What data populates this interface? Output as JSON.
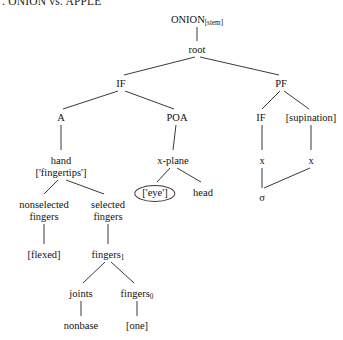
{
  "caption": {
    "text": ". ONION vs. APPLE"
  },
  "diagram": {
    "type": "linguistic-tree",
    "line_color": "#3a3a3a",
    "background": "#ffffff",
    "nodes": [
      {
        "id": "onion",
        "label": "ONION",
        "sub": "[stem]",
        "x": 197,
        "y": 14
      },
      {
        "id": "root",
        "label": "root",
        "x": 197,
        "y": 44
      },
      {
        "id": "if1",
        "label": "IF",
        "x": 121,
        "y": 78
      },
      {
        "id": "pf",
        "label": "PF",
        "x": 281,
        "y": 78
      },
      {
        "id": "a",
        "label": "A",
        "x": 61,
        "y": 112
      },
      {
        "id": "poa",
        "label": "POA",
        "x": 177,
        "y": 112
      },
      {
        "id": "if2",
        "label": "IF",
        "x": 261,
        "y": 112
      },
      {
        "id": "supination",
        "label": "[supination]",
        "x": 311,
        "y": 112
      },
      {
        "id": "hand",
        "label": "hand",
        "line2": "['fingertips']",
        "x": 61,
        "y": 155
      },
      {
        "id": "xplane",
        "label": "x-plane",
        "x": 173,
        "y": 155
      },
      {
        "id": "x-left",
        "label": "x",
        "x": 262,
        "y": 155
      },
      {
        "id": "x-right",
        "label": "x",
        "x": 311,
        "y": 155
      },
      {
        "id": "eye",
        "label": "['eye']",
        "x": 155,
        "y": 185,
        "shape": "ellipse"
      },
      {
        "id": "head",
        "label": "head",
        "x": 203,
        "y": 187
      },
      {
        "id": "sigma",
        "label": "σ",
        "x": 262,
        "y": 192
      },
      {
        "id": "nonselected",
        "label": "nonselected",
        "line2": "fingers",
        "x": 44,
        "y": 199
      },
      {
        "id": "selected",
        "label": "selected",
        "line2": "fingers",
        "x": 108,
        "y": 199
      },
      {
        "id": "flexed",
        "label": "[flexed]",
        "x": 44,
        "y": 249
      },
      {
        "id": "fingers1",
        "label": "fingers",
        "sub": "1",
        "x": 108,
        "y": 249
      },
      {
        "id": "joints",
        "label": "joints",
        "x": 81,
        "y": 288
      },
      {
        "id": "fingers0",
        "label": "fingers",
        "sub": "0",
        "x": 137,
        "y": 288
      },
      {
        "id": "nonbase",
        "label": "nonbase",
        "x": 81,
        "y": 320
      },
      {
        "id": "one",
        "label": "[one]",
        "x": 137,
        "y": 320
      }
    ],
    "edges": [
      {
        "from": "onion",
        "to": "root",
        "x1": 197,
        "y1": 27,
        "x2": 197,
        "y2": 41
      },
      {
        "from": "root",
        "to": "if1",
        "x1": 195,
        "y1": 57,
        "x2": 124,
        "y2": 75
      },
      {
        "from": "root",
        "to": "pf",
        "x1": 200,
        "y1": 57,
        "x2": 279,
        "y2": 75
      },
      {
        "from": "if1",
        "to": "a",
        "x1": 118,
        "y1": 91,
        "x2": 63,
        "y2": 109
      },
      {
        "from": "if1",
        "to": "poa",
        "x1": 125,
        "y1": 91,
        "x2": 174,
        "y2": 109
      },
      {
        "from": "pf",
        "to": "if2",
        "x1": 280,
        "y1": 91,
        "x2": 262,
        "y2": 109
      },
      {
        "from": "pf",
        "to": "supination",
        "x1": 284,
        "y1": 91,
        "x2": 309,
        "y2": 109
      },
      {
        "from": "a",
        "to": "hand",
        "x1": 61,
        "y1": 125,
        "x2": 61,
        "y2": 150
      },
      {
        "from": "poa",
        "to": "xplane",
        "x1": 176,
        "y1": 125,
        "x2": 173,
        "y2": 150
      },
      {
        "from": "if2",
        "to": "x-left",
        "x1": 262,
        "y1": 125,
        "x2": 262,
        "y2": 150
      },
      {
        "from": "supination",
        "to": "x-right",
        "x1": 311,
        "y1": 125,
        "x2": 311,
        "y2": 150
      },
      {
        "from": "hand",
        "to": "nonselected",
        "x1": 58,
        "y1": 180,
        "x2": 44,
        "y2": 194
      },
      {
        "from": "hand",
        "to": "selected",
        "x1": 66,
        "y1": 180,
        "x2": 104,
        "y2": 194
      },
      {
        "from": "xplane",
        "to": "eye",
        "x1": 170,
        "y1": 168,
        "x2": 157,
        "y2": 182
      },
      {
        "from": "xplane",
        "to": "head",
        "x1": 177,
        "y1": 168,
        "x2": 201,
        "y2": 182
      },
      {
        "from": "x-left",
        "to": "sigma",
        "x1": 262,
        "y1": 168,
        "x2": 262,
        "y2": 188
      },
      {
        "from": "x-right",
        "to": "sigma",
        "x1": 310,
        "y1": 168,
        "x2": 264,
        "y2": 188
      },
      {
        "from": "nonselected",
        "to": "flexed",
        "x1": 44,
        "y1": 224,
        "x2": 44,
        "y2": 244
      },
      {
        "from": "selected",
        "to": "fingers1",
        "x1": 108,
        "y1": 224,
        "x2": 108,
        "y2": 244
      },
      {
        "from": "fingers1",
        "to": "joints",
        "x1": 105,
        "y1": 262,
        "x2": 83,
        "y2": 283
      },
      {
        "from": "fingers1",
        "to": "fingers0",
        "x1": 111,
        "y1": 262,
        "x2": 134,
        "y2": 283
      },
      {
        "from": "joints",
        "to": "nonbase",
        "x1": 81,
        "y1": 301,
        "x2": 81,
        "y2": 316
      },
      {
        "from": "fingers0",
        "to": "one",
        "x1": 137,
        "y1": 301,
        "x2": 137,
        "y2": 316
      }
    ]
  }
}
